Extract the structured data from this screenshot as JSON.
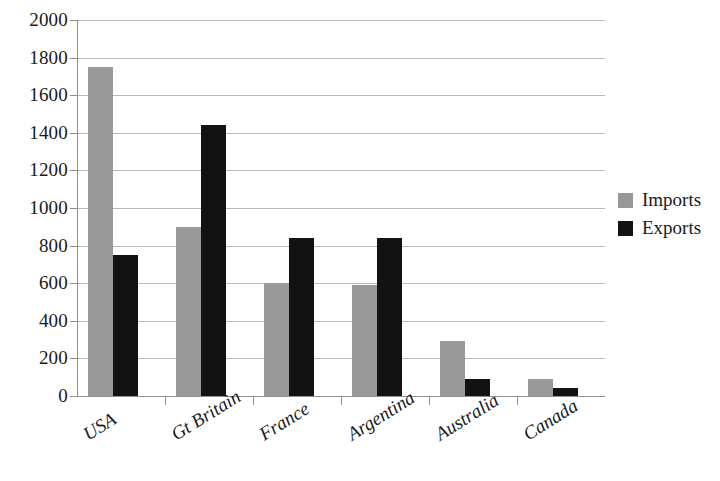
{
  "chart_data": {
    "type": "bar",
    "title": "",
    "subtitle": "",
    "xlabel": "",
    "ylabel": "",
    "categories": [
      "USA",
      "Gt Britain",
      "France",
      "Argentina",
      "Australia",
      "Canada"
    ],
    "series": [
      {
        "name": "Imports",
        "color": "#989898",
        "values": [
          1750,
          900,
          600,
          590,
          290,
          90
        ]
      },
      {
        "name": "Exports",
        "color": "#121212",
        "values": [
          750,
          1440,
          840,
          840,
          90,
          40
        ]
      }
    ],
    "ylim": [
      0,
      2000
    ],
    "ytick_step": 200,
    "yticks": [
      "0",
      "200",
      "400",
      "600",
      "800",
      "1000",
      "1200",
      "1400",
      "1600",
      "1800",
      "2000"
    ],
    "grid": true,
    "grid_axis": "y",
    "legend": {
      "position": "right",
      "entries": [
        {
          "label": "Imports",
          "color": "#989898"
        },
        {
          "label": "Exports",
          "color": "#121212"
        }
      ]
    },
    "xtick_label_rotation_deg": -32,
    "bar_group_count": 6,
    "bars_per_group": 2
  },
  "colors": {
    "imports": "#989898",
    "exports": "#121212",
    "gridline": "#b9b9b9",
    "axis": "#8e8e8e",
    "text": "#1a1a1a",
    "background": "#ffffff"
  }
}
